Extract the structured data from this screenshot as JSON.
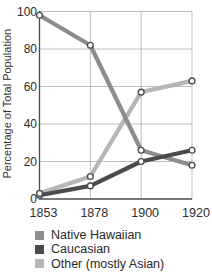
{
  "figure": {
    "background": "#ffffff"
  },
  "chart_data": {
    "type": "line",
    "title": "",
    "xlabel": "",
    "ylabel": "Percentage of Total Population",
    "categories": [
      "1853",
      "1878",
      "1900",
      "1920"
    ],
    "yticks": [
      0,
      20,
      40,
      60,
      80,
      100
    ],
    "ylim": [
      0,
      100
    ],
    "grid": true,
    "legend_position": "bottom-left",
    "axis_color": "#4c4c4c",
    "grid_color": "#b8b8b8",
    "tick_label_color": "#2d2d2d",
    "marker": {
      "shape": "circle",
      "fill": "#ffffff",
      "stroke": "#4c4c4c"
    },
    "series": [
      {
        "name": "Native Hawaiian",
        "color": "#8d8d8f",
        "values": [
          98,
          82,
          26,
          18
        ]
      },
      {
        "name": "Caucasian",
        "color": "#4b4b4d",
        "values": [
          2,
          7,
          20,
          26
        ]
      },
      {
        "name": "Other (mostly Asian)",
        "color": "#b6b6b8",
        "values": [
          3,
          12,
          57,
          63
        ]
      }
    ]
  }
}
